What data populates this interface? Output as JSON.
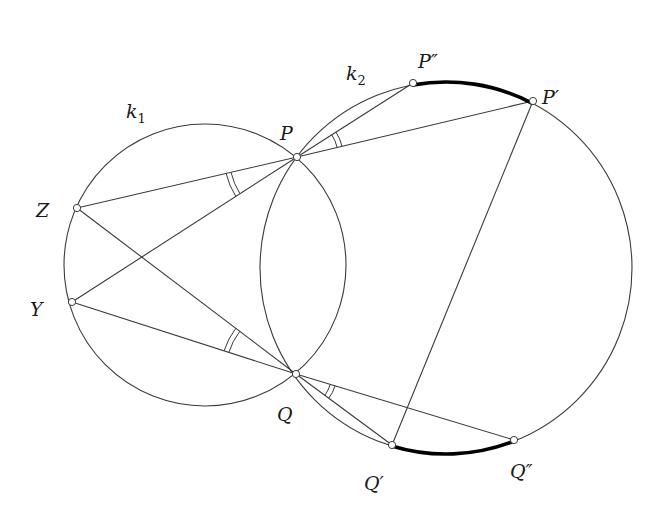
{
  "figure": {
    "circles": [
      {
        "id": "k1",
        "label": "k",
        "subscript": "1",
        "cx": 205,
        "cy": 265,
        "r": 141,
        "label_x": 126,
        "label_y": 118
      },
      {
        "id": "k2",
        "label": "k",
        "subscript": "2",
        "cx": 446,
        "cy": 268,
        "r": 186,
        "label_x": 346,
        "label_y": 80
      }
    ],
    "points": {
      "P": {
        "label": "P",
        "x": 297,
        "y": 157,
        "label_x": 280,
        "label_y": 140
      },
      "Q": {
        "label": "Q",
        "x": 296,
        "y": 374,
        "label_x": 277,
        "label_y": 421
      },
      "Z": {
        "label": "Z",
        "x": 77,
        "y": 208,
        "label_x": 36,
        "label_y": 217
      },
      "Y": {
        "label": "Y",
        "x": 72,
        "y": 302,
        "label_x": 30,
        "label_y": 316
      },
      "P2": {
        "label": "P″",
        "x": 413,
        "y": 83,
        "label_x": 418,
        "label_y": 68
      },
      "P1": {
        "label": "P′",
        "x": 533,
        "y": 101,
        "label_x": 542,
        "label_y": 104
      },
      "Q1": {
        "label": "Q′",
        "x": 392,
        "y": 445,
        "label_x": 364,
        "label_y": 490
      },
      "Q2": {
        "label": "Q″",
        "x": 514,
        "y": 440,
        "label_x": 510,
        "label_y": 478
      }
    },
    "segments": [
      [
        "Z",
        "P"
      ],
      [
        "Y",
        "P"
      ],
      [
        "Z",
        "Q"
      ],
      [
        "Y",
        "Q"
      ],
      [
        "P",
        "P2"
      ],
      [
        "P",
        "P1"
      ],
      [
        "Q",
        "Q1"
      ],
      [
        "Q",
        "Q2"
      ],
      [
        "P1",
        "Q1"
      ]
    ],
    "highlighted_arcs": [
      {
        "from": "P2",
        "to": "P1",
        "circle": "k2"
      },
      {
        "from": "Q1",
        "to": "Q2",
        "circle": "k2"
      }
    ],
    "angle_marks": [
      {
        "vertex": "P",
        "between": [
          "Z",
          "Y"
        ],
        "style": "double-arc"
      },
      {
        "vertex": "Q",
        "between": [
          "Z",
          "Y"
        ],
        "style": "double-arc"
      },
      {
        "vertex": "P",
        "between": [
          "P2",
          "P1"
        ],
        "style": "double-arc"
      },
      {
        "vertex": "Q",
        "between": [
          "Q1",
          "Q2"
        ],
        "style": "double-arc"
      }
    ],
    "colors": {
      "line": "#3a3a3a",
      "highlight": "#000000",
      "background": "#ffffff"
    }
  }
}
